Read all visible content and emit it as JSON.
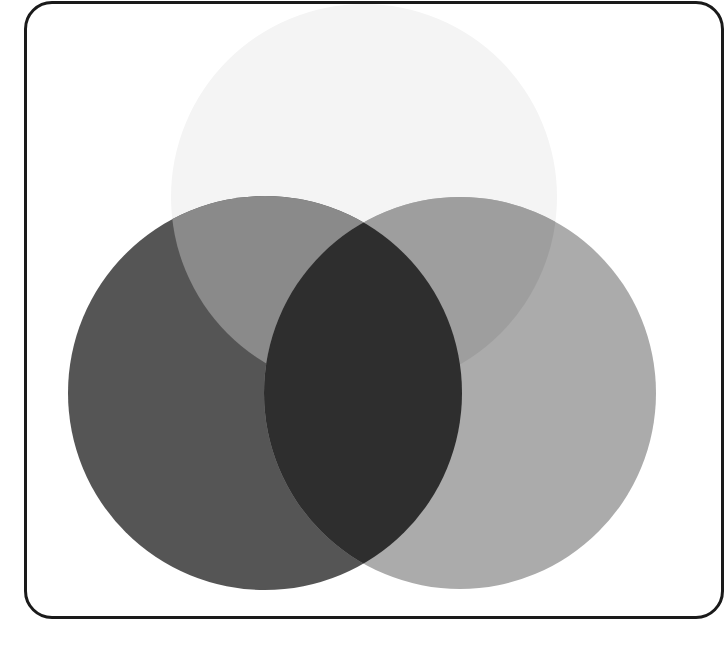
{
  "diagram": {
    "type": "venn",
    "set_count": 3,
    "labels": [],
    "frame": {
      "stroke_color": "#1a1a1a",
      "background": "#ffffff"
    },
    "circles": [
      {
        "id": "top",
        "cx": 364,
        "cy": 197,
        "r": 193,
        "fill": "#f4f4f4"
      },
      {
        "id": "left",
        "cx": 265,
        "cy": 393,
        "r": 197,
        "fill": "#555555"
      },
      {
        "id": "right",
        "cx": 460,
        "cy": 393,
        "r": 196,
        "fill": "#ababab"
      }
    ],
    "regions": {
      "left_only": "#555555",
      "right_only": "#ababab",
      "left_right_intersection": "#2e2e2e",
      "top_left_overlap": "#8a8a8a",
      "top_right_overlap": "#9e9e9e",
      "top_only": "#f4f4f4"
    }
  }
}
